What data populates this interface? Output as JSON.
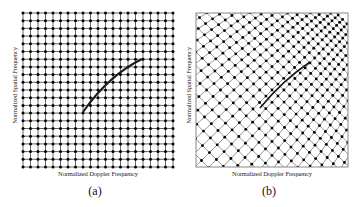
{
  "figure": {
    "panels": [
      {
        "id": "a",
        "caption": "(a)",
        "xlabel": "Normalized Doppler Frequency",
        "ylabel": "Normalized Spatial Frequency",
        "grid": "uniform rectangular lattice of sample points with horizontal and vertical lines",
        "grid_lines": 21
      },
      {
        "id": "b",
        "caption": "(b)",
        "xlabel": "Normalized Doppler Frequency",
        "ylabel": "Normalized Spatial Frequency",
        "grid": "rotated / warped diagonal lattice of sample points inside a framed box",
        "grid_lines": 24
      }
    ]
  },
  "colors": {
    "line": "#1a1a1a",
    "dot": "#000000",
    "grid": "#333333",
    "frame": "#888888"
  }
}
